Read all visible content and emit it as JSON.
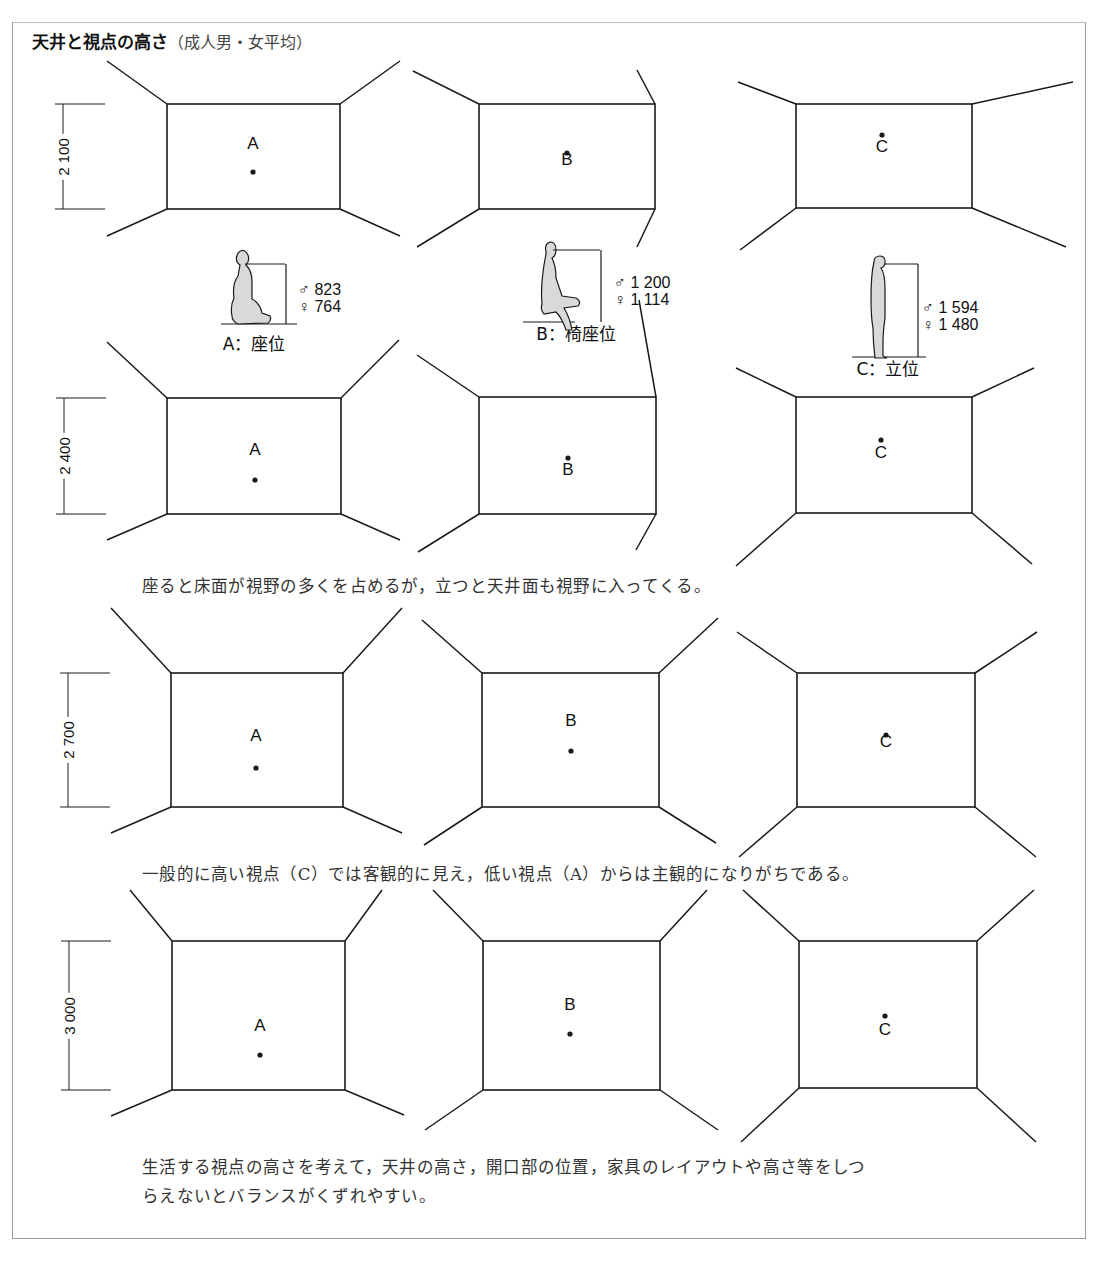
{
  "title": {
    "main": "天井と視点の高さ",
    "sub": "（成人男・女平均）"
  },
  "captions": [
    {
      "text": "座ると床面が視野の多くを占めるが，立つと天井面も視野に入ってくる。",
      "top": 573
    },
    {
      "text": "一般的に高い視点（C）では客観的に見え，低い視点（A）からは主観的になりがちである。",
      "top": 861
    },
    {
      "text": "生活する視点の高さを考えて，天井の高さ，開口部の位置，家具のレイアウトや高さ等をしつ",
      "top": 1154
    },
    {
      "text": "らえないとバランスがくずれやすい。",
      "top": 1183
    }
  ],
  "postures": [
    {
      "id": "A",
      "label": "A：座位",
      "male": "823",
      "female": "764",
      "label_x": 254,
      "label_y": 340,
      "val_x": 298,
      "val_y": 281
    },
    {
      "id": "B",
      "label": "B：椅座位",
      "male": "1 200",
      "female": "1 114",
      "label_x": 576,
      "label_y": 330,
      "val_x": 614,
      "val_y": 274
    },
    {
      "id": "C",
      "label": "C：立位",
      "male": "1 594",
      "female": "1 480",
      "label_x": 888,
      "label_y": 365,
      "val_x": 922,
      "val_y": 299
    }
  ],
  "symbols": {
    "male": "♂",
    "female": "♀"
  },
  "rows": [
    {
      "ceiling_height": "2 100",
      "dim": {
        "x": 63,
        "top": 104,
        "bottom": 209
      },
      "rooms": [
        {
          "point": "A",
          "rect": [
            167,
            104,
            340,
            209
          ],
          "outer": [
            [
              107,
              61
            ],
            [
              107,
              61
            ],
            [
              107,
              236
            ],
            [
              400,
              236
            ]
          ],
          "tl": [
            107,
            61
          ],
          "tr": [
            400,
            61
          ],
          "bl": [
            107,
            236
          ],
          "br": [
            400,
            236
          ],
          "dot": [
            253,
            172
          ],
          "label_y": 146,
          "label_above": true
        },
        {
          "point": "B",
          "rect": [
            479,
            104,
            655,
            209
          ],
          "tl": [
            413,
            71
          ],
          "tr": [
            637,
            70
          ],
          "bl": [
            417,
            247
          ],
          "br": [
            637,
            247
          ],
          "dot": [
            567,
            153
          ],
          "label_y": 160,
          "label_above": false
        },
        {
          "point": "C",
          "rect": [
            796,
            104,
            972,
            208
          ],
          "tl": [
            738,
            82
          ],
          "tr": [
            1073,
            82
          ],
          "bl": [
            740,
            250
          ],
          "br": [
            1066,
            247
          ],
          "dot": [
            882,
            135
          ],
          "label_y": 147,
          "label_above": false
        }
      ]
    },
    {
      "ceiling_height": "2 400",
      "dim": {
        "x": 64,
        "top": 398,
        "bottom": 514
      },
      "rooms": [
        {
          "point": "A",
          "rect": [
            167,
            398,
            341,
            514
          ],
          "tl": [
            107,
            342
          ],
          "tr": [
            399,
            340
          ],
          "bl": [
            107,
            540
          ],
          "br": [
            400,
            540
          ],
          "dot": [
            255,
            480
          ],
          "label_y": 452,
          "label_above": true
        },
        {
          "point": "B",
          "rect": [
            479,
            397,
            656,
            514
          ],
          "tl": [
            417,
            355
          ],
          "tr": [
            639,
            300
          ],
          "bl": [
            418,
            552
          ],
          "br": [
            636,
            550
          ],
          "dot": [
            568,
            458
          ],
          "label_y": 470,
          "label_above": false
        },
        {
          "point": "C",
          "rect": [
            796,
            397,
            972,
            513
          ],
          "tl": [
            736,
            368
          ],
          "tr": [
            1034,
            368
          ],
          "bl": [
            736,
            566
          ],
          "br": [
            1032,
            564
          ],
          "dot": [
            881,
            440
          ],
          "label_y": 453,
          "label_above": false
        }
      ]
    },
    {
      "ceiling_height": "2 700",
      "dim": {
        "x": 68,
        "top": 673,
        "bottom": 807
      },
      "rooms": [
        {
          "point": "A",
          "rect": [
            171,
            673,
            343,
            807
          ],
          "tl": [
            111,
            608
          ],
          "tr": [
            402,
            608
          ],
          "bl": [
            111,
            833
          ],
          "br": [
            402,
            833
          ],
          "dot": [
            256,
            768
          ],
          "label_y": 738,
          "label_above": true
        },
        {
          "point": "B",
          "rect": [
            482,
            673,
            659,
            807
          ],
          "tl": [
            422,
            620
          ],
          "tr": [
            718,
            618
          ],
          "bl": [
            424,
            845
          ],
          "br": [
            716,
            843
          ],
          "dot": [
            571,
            751
          ],
          "label_y": 723,
          "label_above": true
        },
        {
          "point": "C",
          "rect": [
            797,
            673,
            975,
            807
          ],
          "tl": [
            737,
            632
          ],
          "tr": [
            1037,
            632
          ],
          "bl": [
            739,
            857
          ],
          "br": [
            1036,
            857
          ],
          "dot": [
            886,
            735
          ],
          "label_y": 742,
          "label_above": false
        }
      ]
    },
    {
      "ceiling_height": "3 000",
      "dim": {
        "x": 69,
        "top": 941,
        "bottom": 1090
      },
      "rooms": [
        {
          "point": "A",
          "rect": [
            172,
            941,
            345,
            1090
          ],
          "tl": [
            130,
            890
          ],
          "tr": [
            382,
            890
          ],
          "bl": [
            111,
            1116
          ],
          "br": [
            404,
            1115
          ],
          "dot": [
            260,
            1055
          ],
          "label_y": 1028,
          "label_above": true
        },
        {
          "point": "B",
          "rect": [
            483,
            941,
            660,
            1090
          ],
          "tl": [
            433,
            890
          ],
          "tr": [
            707,
            890
          ],
          "bl": [
            425,
            1130
          ],
          "br": [
            718,
            1130
          ],
          "dot": [
            570,
            1034
          ],
          "label_y": 1007,
          "label_above": true
        },
        {
          "point": "C",
          "rect": [
            799,
            941,
            977,
            1088
          ],
          "tl": [
            743,
            890
          ],
          "tr": [
            1034,
            890
          ],
          "bl": [
            741,
            1142
          ],
          "br": [
            1036,
            1142
          ],
          "dot": [
            885,
            1016
          ],
          "label_y": 1030,
          "label_above": false
        }
      ]
    }
  ],
  "colors": {
    "line": "#1a1a1a",
    "figure_fill": "#d9d9d9",
    "frame": "#9a9a9a"
  }
}
